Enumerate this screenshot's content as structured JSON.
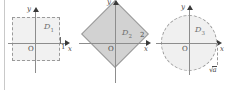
{
  "figure": {
    "background_color": "#ffffff",
    "axis_color": "#8d8d8d",
    "shape_fill": "#d2d2d2",
    "shape_stroke": "#9a9a9a"
  },
  "panels": [
    {
      "id": "panel-1",
      "region_label": "D",
      "region_sub": "1",
      "shape": "square",
      "style": "dashed",
      "origin_label": "O",
      "x_axis_label": "x",
      "y_axis_label": "y",
      "x_mark": "1"
    },
    {
      "id": "panel-2",
      "region_label": "D",
      "region_sub": "2",
      "shape": "diamond",
      "style": "solid-filled",
      "origin_label": "O",
      "x_axis_label": "x",
      "y_axis_label": "y",
      "x_mark": "2"
    },
    {
      "id": "panel-3",
      "region_label": "D",
      "region_sub": "3",
      "shape": "circle",
      "style": "dashed",
      "origin_label": "O",
      "x_axis_label": "x",
      "y_axis_label": "y",
      "radius_label": "a",
      "radius_prefix": "√"
    }
  ]
}
